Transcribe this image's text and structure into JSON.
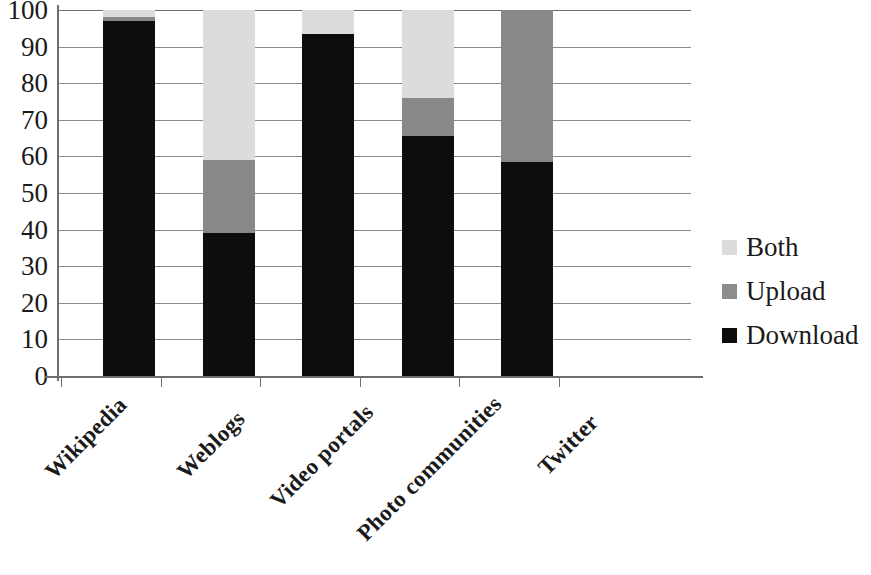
{
  "chart_data": {
    "type": "bar",
    "subtype": "stacked-bar",
    "title": "",
    "xlabel": "",
    "ylabel": "",
    "ylim": [
      0,
      100
    ],
    "yticks": [
      0,
      10,
      20,
      30,
      40,
      50,
      60,
      70,
      80,
      90,
      100
    ],
    "ytick_labels": [
      "0",
      "10",
      "20",
      "30",
      "40",
      "50",
      "60",
      "70",
      "80",
      "90",
      "100"
    ],
    "grid": true,
    "legend_position": "right",
    "categories": [
      "Wikipedia",
      "Weblogs",
      "Video portals",
      "Photo communities",
      "Twitter"
    ],
    "series": [
      {
        "name": "Download",
        "color": "#0d0d0d",
        "values": [
          97,
          39,
          93.5,
          65.5,
          58.5
        ]
      },
      {
        "name": "Upload",
        "color": "#888888",
        "values": [
          1,
          20,
          0,
          10.5,
          41.5
        ]
      },
      {
        "name": "Both",
        "color": "#dcdcdc",
        "values": [
          2,
          41,
          6.5,
          24,
          0
        ]
      }
    ]
  },
  "axis": {
    "y_tick_labels": [
      "100",
      "90",
      "80",
      "70",
      "60",
      "50",
      "40",
      "30",
      "20",
      "10",
      "0"
    ]
  },
  "legend": {
    "items": [
      {
        "label": "Both",
        "color": "#dcdcdc"
      },
      {
        "label": "Upload",
        "color": "#8c8c8c"
      },
      {
        "label": "Download",
        "color": "#0d0d0d"
      }
    ]
  },
  "categories": [
    {
      "label": "Wikipedia"
    },
    {
      "label": "Weblogs"
    },
    {
      "label": "Video portals"
    },
    {
      "label": "Photo communities"
    },
    {
      "label": "Twitter"
    }
  ]
}
